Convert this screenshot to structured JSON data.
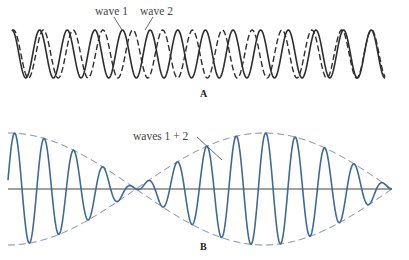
{
  "panel_a": {
    "label": "A",
    "wave1_label": "wave 1",
    "wave2_label": "wave 2",
    "wave1": {
      "name": "wave 1",
      "style": "solid",
      "cycles": 13.5,
      "phase": 0.25
    },
    "wave2": {
      "name": "wave 2",
      "style": "dashed",
      "cycles": 12.5,
      "phase": 0.2
    }
  },
  "panel_b": {
    "label": "B",
    "sum_label": "waves 1 + 2",
    "carrier_cycles": 13,
    "beat_half_periods": 1.5,
    "envelope_style": "dashed"
  },
  "colors": {
    "panel_a_line": "#2e2e2e",
    "panel_b_line": "#3f6a94",
    "axis": "#444444",
    "envelope": "#5a6f85",
    "text": "#444444"
  }
}
